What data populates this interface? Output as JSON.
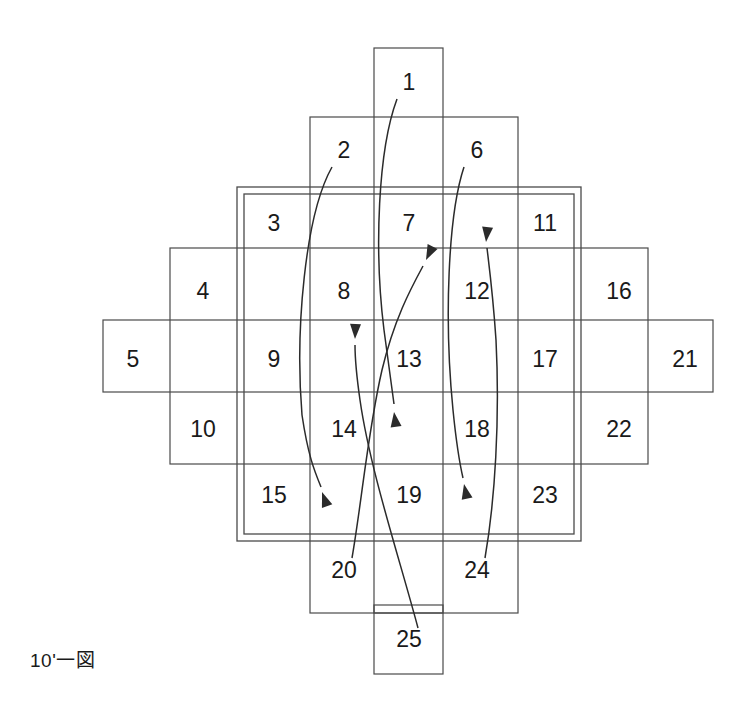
{
  "figure": {
    "caption": "10'一図",
    "colors": {
      "background": "#ffffff",
      "line": "#4a4a4a",
      "arrow": "#2b2b2b",
      "text": "#1a1a1a"
    },
    "bands": [
      {
        "name": "band-top-col",
        "x": 374,
        "y": 48,
        "w": 69,
        "h": 565
      },
      {
        "name": "band-row2",
        "x": 310,
        "y": 117,
        "w": 208,
        "h": 496
      },
      {
        "name": "band-row3",
        "x": 170,
        "y": 248,
        "w": 478,
        "h": 216
      },
      {
        "name": "band-row-mid",
        "x": 103,
        "y": 320,
        "w": 610,
        "h": 72
      },
      {
        "name": "band-bottom-col",
        "x": 374,
        "y": 605,
        "w": 69,
        "h": 69
      }
    ],
    "inner_frame": {
      "outer": {
        "x": 237,
        "y": 187,
        "w": 344,
        "h": 354
      },
      "inner": {
        "x": 244,
        "y": 194,
        "w": 330,
        "h": 340
      }
    },
    "cells": [
      {
        "id": "1",
        "label": "1",
        "x": 409,
        "y": 84
      },
      {
        "id": "2",
        "label": "2",
        "x": 344,
        "y": 152
      },
      {
        "id": "3",
        "label": "3",
        "x": 274,
        "y": 225
      },
      {
        "id": "4",
        "label": "4",
        "x": 203,
        "y": 293
      },
      {
        "id": "5",
        "label": "5",
        "x": 133,
        "y": 361
      },
      {
        "id": "6",
        "label": "6",
        "x": 477,
        "y": 152
      },
      {
        "id": "7",
        "label": "7",
        "x": 409,
        "y": 225
      },
      {
        "id": "8",
        "label": "8",
        "x": 344,
        "y": 293
      },
      {
        "id": "9",
        "label": "9",
        "x": 274,
        "y": 361
      },
      {
        "id": "10",
        "label": "10",
        "x": 203,
        "y": 431
      },
      {
        "id": "11",
        "label": "11",
        "x": 545,
        "y": 225
      },
      {
        "id": "12",
        "label": "12",
        "x": 477,
        "y": 293
      },
      {
        "id": "13",
        "label": "13",
        "x": 409,
        "y": 361
      },
      {
        "id": "14",
        "label": "14",
        "x": 344,
        "y": 431
      },
      {
        "id": "15",
        "label": "15",
        "x": 274,
        "y": 497
      },
      {
        "id": "16",
        "label": "16",
        "x": 619,
        "y": 293
      },
      {
        "id": "17",
        "label": "17",
        "x": 545,
        "y": 361
      },
      {
        "id": "18",
        "label": "18",
        "x": 477,
        "y": 431
      },
      {
        "id": "19",
        "label": "19",
        "x": 409,
        "y": 497
      },
      {
        "id": "20",
        "label": "20",
        "x": 344,
        "y": 572
      },
      {
        "id": "21",
        "label": "21",
        "x": 685,
        "y": 361
      },
      {
        "id": "22",
        "label": "22",
        "x": 619,
        "y": 431
      },
      {
        "id": "23",
        "label": "23",
        "x": 545,
        "y": 497
      },
      {
        "id": "24",
        "label": "24",
        "x": 477,
        "y": 572
      },
      {
        "id": "25",
        "label": "25",
        "x": 409,
        "y": 641
      }
    ],
    "leaders": [
      {
        "name": "leader-from-2",
        "from_label": "2",
        "path": "M 332 167 C 305 215 295 330 302 415 C 308 455 314 470 321 487",
        "arrow": {
          "x": 322,
          "y": 492,
          "angle": 70
        }
      },
      {
        "name": "leader-from-1",
        "from_label": "1",
        "path": "M 397 99 C 378 150 374 250 384 330 C 390 375 392 390 394 404",
        "arrow": {
          "x": 394,
          "y": 412,
          "angle": 82
        }
      },
      {
        "name": "leader-from-20",
        "from_label": "20",
        "path": "M 352 558 C 362 500 368 430 382 370 C 394 320 410 290 423 266",
        "arrow": {
          "x": 426,
          "y": 260,
          "angle": -64
        }
      },
      {
        "name": "leader-from-6",
        "from_label": "6",
        "path": "M 464 167 C 448 215 444 320 453 410 C 457 450 460 465 463 478",
        "arrow": {
          "x": 464,
          "y": 484,
          "angle": 78
        }
      },
      {
        "name": "leader-from-24",
        "from_label": "24",
        "path": "M 485 558 C 495 500 500 420 496 340 C 493 295 489 265 487 248",
        "arrow": {
          "x": 486,
          "y": 242,
          "angle": -84
        }
      },
      {
        "name": "leader-from-25",
        "from_label": "25",
        "path": "M 418 628 C 400 560 370 470 360 400 C 355 365 355 355 355 345",
        "arrow": {
          "x": 355,
          "y": 339,
          "angle": -88
        }
      }
    ]
  }
}
